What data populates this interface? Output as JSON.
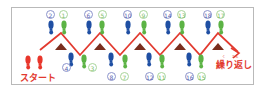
{
  "diagram": {
    "start_label": "スタート",
    "repeat_label": "繰り返し",
    "repeat_furigana": [
      "く",
      "かえ"
    ],
    "colors": {
      "start_foot": "#e8362b",
      "left_foot": "#1f4fa3",
      "right_foot": "#5cb345",
      "path_line": "#e23a2f",
      "triangle": "#7a2e1e",
      "border": "#b9b9b9"
    },
    "steps": [
      {
        "n": "1",
        "foot": "green",
        "row": "top"
      },
      {
        "n": "2",
        "foot": "blue",
        "row": "top"
      },
      {
        "n": "3",
        "foot": "green",
        "row": "bottom"
      },
      {
        "n": "4",
        "foot": "blue",
        "row": "bottom"
      },
      {
        "n": "5",
        "foot": "green",
        "row": "top"
      },
      {
        "n": "6",
        "foot": "blue",
        "row": "top"
      },
      {
        "n": "7",
        "foot": "green",
        "row": "bottom"
      },
      {
        "n": "8",
        "foot": "blue",
        "row": "bottom"
      },
      {
        "n": "9",
        "foot": "green",
        "row": "top"
      },
      {
        "n": "10",
        "foot": "blue",
        "row": "top"
      },
      {
        "n": "11",
        "foot": "green",
        "row": "bottom"
      },
      {
        "n": "12",
        "foot": "blue",
        "row": "bottom"
      },
      {
        "n": "13",
        "foot": "green",
        "row": "top"
      },
      {
        "n": "14",
        "foot": "blue",
        "row": "top"
      },
      {
        "n": "15",
        "foot": "green",
        "row": "bottom"
      },
      {
        "n": "16",
        "foot": "blue",
        "row": "bottom"
      },
      {
        "n": "17",
        "foot": "green",
        "row": "top"
      },
      {
        "n": "18",
        "foot": "blue",
        "row": "top"
      }
    ],
    "num_labels": {
      "n1": "1",
      "n2": "2",
      "n3": "3",
      "n4": "4",
      "n5": "5",
      "n6": "6",
      "n7": "7",
      "n8": "8",
      "n9": "9",
      "n10": "10",
      "n11": "11",
      "n12": "12",
      "n13": "13",
      "n14": "14",
      "n15": "15",
      "n16": "16",
      "n17": "17",
      "n18": "18"
    }
  }
}
